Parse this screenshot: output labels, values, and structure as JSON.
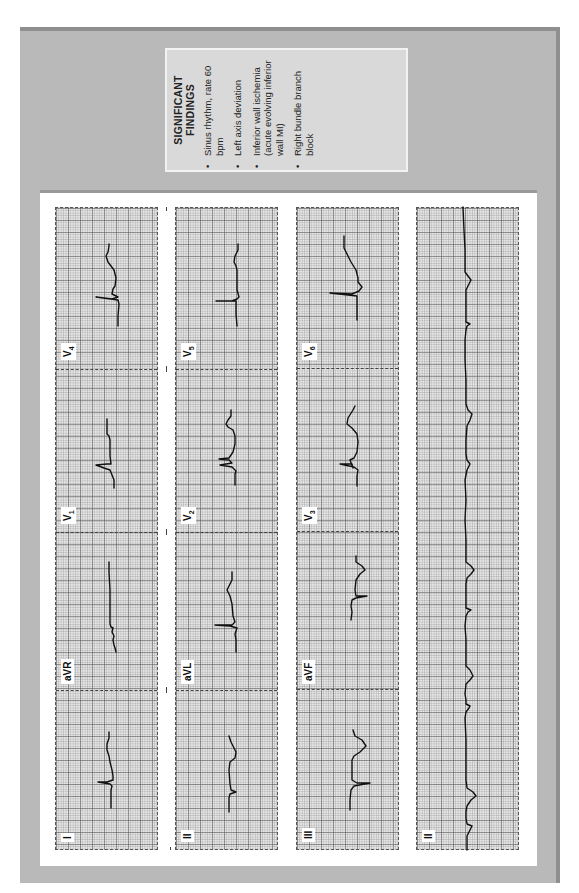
{
  "findings": {
    "title": "SIGNIFICANT FINDINGS",
    "items": [
      "Sinus rhythm, rate 60 bpm",
      "Left axis deviation",
      "Inferior wall ischemia (acute evolving inferior wall MI)",
      "Right bundle branch block"
    ]
  },
  "ecg": {
    "columns": [
      {
        "leads": [
          "I",
          "aVR",
          "V1",
          "V4"
        ]
      },
      {
        "leads": [
          "II",
          "aVL",
          "V2",
          "V5"
        ]
      },
      {
        "leads": [
          "III",
          "aVF",
          "V3",
          "V6"
        ]
      }
    ],
    "rhythm_strip": {
      "lead": "II"
    },
    "labels": {
      "I": "I",
      "aVR": "aVR",
      "V1": "V",
      "V1_sub": "1",
      "V4": "V",
      "V4_sub": "4",
      "II": "II",
      "aVL": "aVL",
      "V2": "V",
      "V2_sub": "2",
      "V5": "V",
      "V5_sub": "5",
      "III": "III",
      "aVF": "aVF",
      "V3": "V",
      "V3_sub": "3",
      "V6": "V",
      "V6_sub": "6",
      "rhythm": "II"
    },
    "colors": {
      "frame": "#b9b9b9",
      "findings_box": "#d9d9d9",
      "paper": "#e6e6e6",
      "trace": "#111111"
    }
  }
}
